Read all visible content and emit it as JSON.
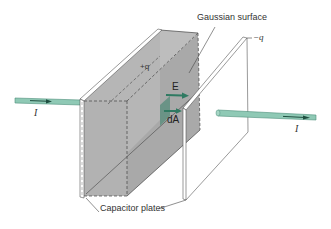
{
  "figure": {
    "type": "physics-diagram"
  },
  "labels": {
    "gaussian_surface": "Gaussian surface",
    "capacitor_plates": "Capacitor plates",
    "plus_q": "+q",
    "minus_q": "−q",
    "field_vector": "E",
    "area_vector": "dA",
    "current_left": "I",
    "current_right": "I"
  },
  "colors": {
    "box_fill": "#b4b4b4",
    "box_side": "#a6a6a6",
    "plate_edge": "#555555",
    "wire_fill": "#8fc9b5",
    "wire_edge": "#4e8f7a",
    "arrow": "#2f7a62",
    "text": "#333333"
  }
}
